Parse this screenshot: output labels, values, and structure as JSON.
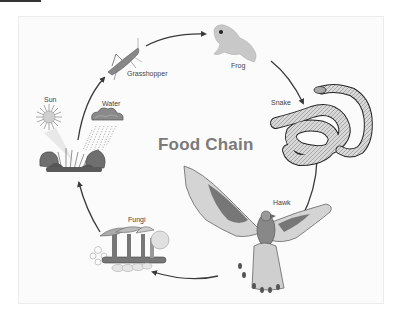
{
  "diagram": {
    "title": "Food Chain",
    "nodes": [
      {
        "id": "sun",
        "label": "Sun",
        "icon": "sun-icon"
      },
      {
        "id": "water",
        "label": "Water",
        "icon": "rain-cloud-icon"
      },
      {
        "id": "plant",
        "label": "",
        "icon": "plant-icon"
      },
      {
        "id": "grasshopper",
        "label": "Grasshopper",
        "icon": "grasshopper-icon"
      },
      {
        "id": "frog",
        "label": "Frog",
        "icon": "frog-icon"
      },
      {
        "id": "snake",
        "label": "Snake",
        "icon": "snake-icon"
      },
      {
        "id": "hawk",
        "label": "Hawk",
        "icon": "hawk-icon"
      },
      {
        "id": "fungi",
        "label": "Fungi",
        "icon": "fungi-icon"
      }
    ],
    "edges": [
      {
        "from": "plant",
        "to": "grasshopper"
      },
      {
        "from": "grasshopper",
        "to": "frog"
      },
      {
        "from": "frog",
        "to": "snake"
      },
      {
        "from": "snake",
        "to": "hawk"
      },
      {
        "from": "hawk",
        "to": "fungi"
      },
      {
        "from": "fungi",
        "to": "plant"
      }
    ],
    "colors": {
      "title": "#7a7a7a",
      "arrow": "#444444",
      "panel_bg": "#fbfbfb"
    }
  }
}
